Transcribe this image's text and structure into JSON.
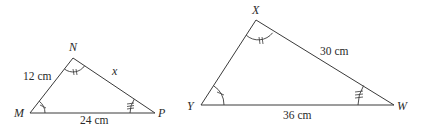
{
  "triangles": [
    {
      "name": "MNP",
      "vertices": {
        "M": {
          "label": "M",
          "x": 30,
          "y": 113
        },
        "N": {
          "label": "N",
          "x": 73,
          "y": 58
        },
        "P": {
          "label": "P",
          "x": 155,
          "y": 113
        }
      },
      "sides": {
        "MN": "12 cm",
        "NP": "x",
        "MP": "24 cm"
      },
      "angle_marks": {
        "M": "single",
        "N": "double",
        "P": "triple"
      }
    },
    {
      "name": "XYW",
      "vertices": {
        "X": {
          "label": "X",
          "x": 256,
          "y": 20
        },
        "Y": {
          "label": "Y",
          "x": 201,
          "y": 105
        },
        "W": {
          "label": "W",
          "x": 394,
          "y": 105
        }
      },
      "sides": {
        "XW": "30 cm",
        "YW": "36 cm"
      },
      "angle_marks": {
        "Y": "single",
        "X": "double",
        "W": "triple"
      }
    }
  ],
  "colors": {
    "line": "#3a3a3a",
    "text": "#2a2a2a",
    "background": "#ffffff"
  }
}
